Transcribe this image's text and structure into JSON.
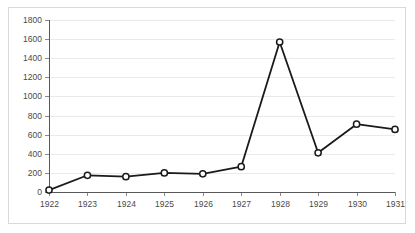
{
  "chart_data": {
    "type": "line",
    "title": "",
    "subtitle": "",
    "xlabel": "",
    "ylabel": "",
    "categories": [
      "1922",
      "1923",
      "1924",
      "1925",
      "1926",
      "1927",
      "1928",
      "1929",
      "1930",
      "1931"
    ],
    "x": [
      1922,
      1923,
      1924,
      1925,
      1926,
      1927,
      1928,
      1929,
      1930,
      1931
    ],
    "values": [
      20,
      175,
      160,
      200,
      190,
      265,
      1570,
      410,
      710,
      655
    ],
    "series": [
      {
        "name": "",
        "values": [
          20,
          175,
          160,
          200,
          190,
          265,
          1570,
          410,
          710,
          655
        ]
      }
    ],
    "ylim": [
      0,
      1800
    ],
    "xlim": [
      1922,
      1931
    ],
    "ytick_labels": [
      "0",
      "200",
      "400",
      "600",
      "800",
      "1000",
      "1200",
      "1400",
      "1600",
      "1800"
    ],
    "ytick_values": [
      0,
      200,
      400,
      600,
      800,
      1000,
      1200,
      1400,
      1600,
      1800
    ],
    "ytick_step": 200,
    "xtick_labels": [
      "1922",
      "1923",
      "1924",
      "1925",
      "1926",
      "1927",
      "1928",
      "1929",
      "1930",
      "1931"
    ],
    "grid": "horizontal",
    "legend": "none",
    "legend_position": "none",
    "marker": "circle-open",
    "annotations": []
  },
  "style": {
    "line_color": "#1a1a1a",
    "marker_fill": "#ffffff",
    "marker_stroke": "#1a1a1a",
    "gridline_color": "#eaeaea",
    "axis_color": "#58585a",
    "tick_color": "#8a8a8a",
    "label_color": "#4a4a4a",
    "frame_border_color": "#d9d9d9",
    "background": "#ffffff"
  }
}
